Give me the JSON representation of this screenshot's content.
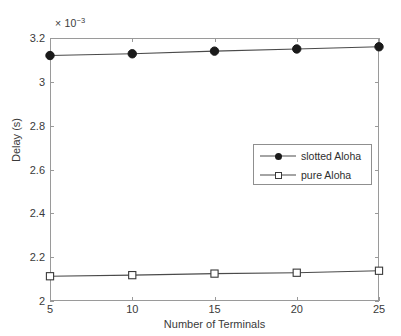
{
  "chart_data": {
    "type": "line",
    "title": "",
    "xlabel": "Number of Terminals",
    "ylabel": "Delay (s)",
    "y_multiplier_text": "× 10",
    "y_multiplier_exponent": "−3",
    "y_multiplier_value": 0.001,
    "x": [
      5,
      10,
      15,
      20,
      25
    ],
    "xlim": [
      5,
      25
    ],
    "ylim": [
      2,
      3.2
    ],
    "xticks": [
      "5",
      "10",
      "15",
      "20",
      "25"
    ],
    "yticks": [
      "2",
      "2.2",
      "2.4",
      "2.6",
      "2.8",
      "3",
      "3.2"
    ],
    "ytick_values": [
      2,
      2.2,
      2.4,
      2.6,
      2.8,
      3,
      3.2
    ],
    "grid": false,
    "legend_position": "center-right",
    "series": [
      {
        "name": "slotted Aloha",
        "marker": "filled-circle",
        "color": "#1a1a1a",
        "values": [
          3.12,
          3.128,
          3.14,
          3.15,
          3.16
        ]
      },
      {
        "name": "pure Aloha",
        "marker": "open-square",
        "color": "#3a3a3a",
        "values": [
          2.113,
          2.118,
          2.125,
          2.129,
          2.138
        ]
      }
    ]
  },
  "legend": {
    "entries": [
      {
        "label": "slotted Aloha"
      },
      {
        "label": "pure Aloha"
      }
    ]
  }
}
